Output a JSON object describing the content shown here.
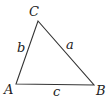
{
  "diagram": {
    "type": "triangle",
    "stroke_color": "#333333",
    "vertices": [
      {
        "label": "A",
        "x": 16,
        "y": 84
      },
      {
        "label": "B",
        "x": 94,
        "y": 85
      },
      {
        "label": "C",
        "x": 38,
        "y": 21
      }
    ],
    "sides": [
      {
        "label": "a",
        "from": "B",
        "to": "C"
      },
      {
        "label": "b",
        "from": "A",
        "to": "C"
      },
      {
        "label": "c",
        "from": "A",
        "to": "B"
      }
    ],
    "labels": {
      "A": "A",
      "B": "B",
      "C": "C",
      "a": "a",
      "b": "b",
      "c": "c"
    }
  }
}
